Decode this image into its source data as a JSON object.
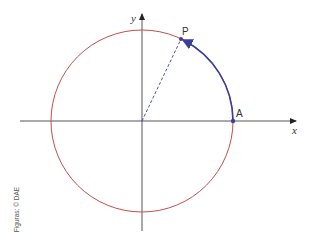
{
  "diagram": {
    "type": "trigonometric-unit-circle",
    "labels": {
      "x_axis": "x",
      "y_axis": "y",
      "point_p": "P",
      "point_a": "A"
    },
    "colors": {
      "circle": "#c0504d",
      "arc": "#3a3f9a",
      "axes": "#333333",
      "radius_dashed": "#3a3f9a",
      "points": "#3a3f9a"
    },
    "geometry": {
      "center": [
        142,
        121
      ],
      "radius": 91,
      "angle_p_degrees": 64.6
    }
  },
  "credit": "Figuras: © DAE"
}
